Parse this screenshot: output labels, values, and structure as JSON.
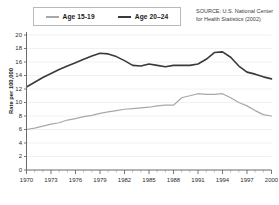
{
  "legend": {
    "entries": [
      {
        "label": "Age 15-19",
        "color": "#a8a8a8"
      },
      {
        "label": "Age 20–24",
        "color": "#3a3a3a"
      }
    ]
  },
  "source": {
    "line1": "SOURCE: U.S. National Center",
    "line2": "for Health Statistics (2002)"
  },
  "axis": {
    "ylabel": "Rate per 100,000"
  },
  "chart_data": {
    "type": "line",
    "title": "",
    "xlabel": "",
    "ylabel": "Rate per 100,000",
    "xlim": [
      1970,
      2000
    ],
    "ylim": [
      0,
      20
    ],
    "ytick_step": 2,
    "yticks": [
      0,
      2,
      4,
      6,
      8,
      10,
      12,
      14,
      16,
      18,
      20
    ],
    "xticks": [
      1970,
      1973,
      1976,
      1979,
      1982,
      1985,
      1988,
      1991,
      1994,
      1997,
      2000
    ],
    "xtick_labels": [
      "1970",
      "1973",
      "1976",
      "1979",
      "1982",
      "1985",
      "1988",
      "1991",
      "1994",
      "1997",
      "2000"
    ],
    "minor_xticks_every": 1,
    "grid": "horizontal",
    "legend_position": "top-left",
    "x": [
      1970,
      1971,
      1972,
      1973,
      1974,
      1975,
      1976,
      1977,
      1978,
      1979,
      1980,
      1981,
      1982,
      1983,
      1984,
      1985,
      1986,
      1987,
      1988,
      1989,
      1990,
      1991,
      1992,
      1993,
      1994,
      1995,
      1996,
      1997,
      1998,
      1999,
      2000
    ],
    "series": [
      {
        "name": "Age 15-19",
        "color": "#a8a8a8",
        "values": [
          6.0,
          6.2,
          6.5,
          6.8,
          7.0,
          7.4,
          7.6,
          7.9,
          8.1,
          8.4,
          8.6,
          8.8,
          9.0,
          9.1,
          9.2,
          9.3,
          9.5,
          9.6,
          9.6,
          10.7,
          11.0,
          11.3,
          11.2,
          11.2,
          11.3,
          10.7,
          10.0,
          9.5,
          8.8,
          8.2,
          8.0
        ]
      },
      {
        "name": "Age 20–24",
        "color": "#3a3a3a",
        "values": [
          12.3,
          13.0,
          13.7,
          14.3,
          14.9,
          15.4,
          15.9,
          16.4,
          16.9,
          17.3,
          17.2,
          16.8,
          16.2,
          15.5,
          15.4,
          15.7,
          15.5,
          15.3,
          15.5,
          15.5,
          15.5,
          15.7,
          16.4,
          17.4,
          17.5,
          16.7,
          15.4,
          14.5,
          14.2,
          13.8,
          13.5
        ]
      }
    ],
    "units": "deaths per 100,000"
  }
}
